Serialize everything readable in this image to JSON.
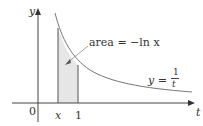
{
  "diagram": {
    "axis_labels": {
      "y": "y",
      "t": "t",
      "origin": "0"
    },
    "tick_labels": {
      "x": "x",
      "one": "1"
    },
    "area_label": "area = −ln x",
    "curve_label": {
      "lhs": "y =",
      "num": "1",
      "den": "t"
    },
    "colors": {
      "shade": "#e6e6e6",
      "curve": "#777777",
      "axis": "#444444"
    }
  }
}
